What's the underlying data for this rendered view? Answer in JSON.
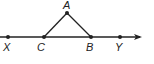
{
  "diagram": {
    "type": "geometry",
    "line": {
      "from": [
        0,
        37
      ],
      "to": [
        142,
        37
      ],
      "arrow": "right"
    },
    "points": [
      {
        "name": "X",
        "x": 8,
        "y": 37,
        "label_x": 3,
        "label_y": 51
      },
      {
        "name": "C",
        "x": 44,
        "y": 37,
        "label_x": 37,
        "label_y": 51
      },
      {
        "name": "B",
        "x": 91,
        "y": 37,
        "label_x": 86,
        "label_y": 51
      },
      {
        "name": "Y",
        "x": 120,
        "y": 37,
        "label_x": 115,
        "label_y": 51
      },
      {
        "name": "A",
        "x": 67,
        "y": 13,
        "label_x": 63,
        "label_y": 9
      }
    ],
    "segments": [
      [
        "C",
        "A"
      ],
      [
        "A",
        "B"
      ]
    ],
    "color": "#222222"
  }
}
